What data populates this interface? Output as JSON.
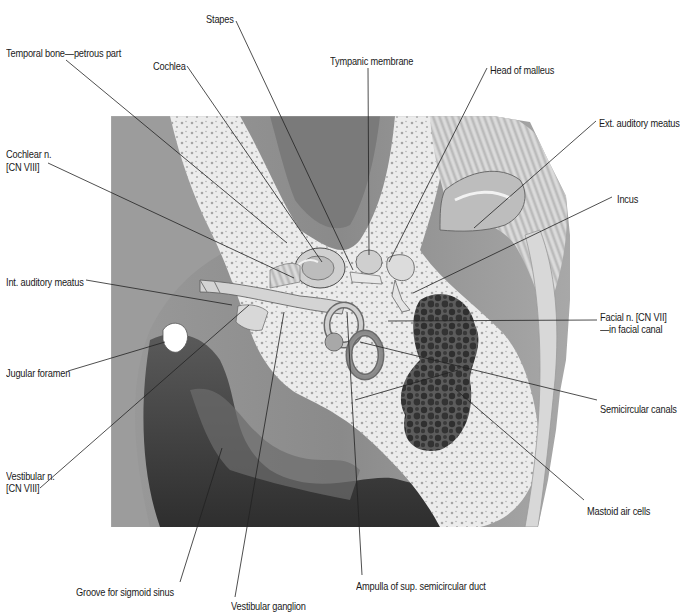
{
  "figure": {
    "colors": {
      "background": "#ffffff",
      "bone_light": "#ebebeb",
      "bone_mid": "#b9b9b9",
      "soft_tissue": "#8f8f8f",
      "dark_cavity": "#3a3a3a",
      "air_cells": "#4a4a4a",
      "leader_line": "#222222",
      "label_text": "#1a1a1a"
    }
  },
  "labels": [
    {
      "id": "stapes",
      "text": "Stapes",
      "x": 206,
      "y": 13
    },
    {
      "id": "temporal-bone-petrous",
      "text": "Temporal bone—petrous part",
      "x": 6,
      "y": 47
    },
    {
      "id": "cochlea",
      "text": "Cochlea",
      "x": 153,
      "y": 60
    },
    {
      "id": "tympanic-membrane",
      "text": "Tympanic membrane",
      "x": 330,
      "y": 55
    },
    {
      "id": "head-of-malleus",
      "text": "Head of malleus",
      "x": 490,
      "y": 64
    },
    {
      "id": "ext-auditory-meatus",
      "text": "Ext. auditory meatus",
      "x": 599,
      "y": 117
    },
    {
      "id": "cochlear-n-line1",
      "text": "Cochlear n.",
      "x": 6,
      "y": 148
    },
    {
      "id": "cochlear-n-line2",
      "text": "[CN VIII]",
      "x": 6,
      "y": 161
    },
    {
      "id": "incus",
      "text": "Incus",
      "x": 617,
      "y": 193
    },
    {
      "id": "int-auditory-meatus",
      "text": "Int. auditory meatus",
      "x": 6,
      "y": 276
    },
    {
      "id": "facial-n-line1",
      "text": "Facial n. [CN VII]",
      "x": 600,
      "y": 311
    },
    {
      "id": "facial-n-line2",
      "text": "—in facial canal",
      "x": 600,
      "y": 323
    },
    {
      "id": "jugular-foramen",
      "text": "Jugular foramen",
      "x": 6,
      "y": 367
    },
    {
      "id": "semicircular-canals",
      "text": "Semicircular canals",
      "x": 600,
      "y": 403
    },
    {
      "id": "vestibular-n-line1",
      "text": "Vestibular n.",
      "x": 6,
      "y": 470
    },
    {
      "id": "vestibular-n-line2",
      "text": "[CN VIII]",
      "x": 6,
      "y": 482
    },
    {
      "id": "mastoid-air-cells",
      "text": "Mastoid air cells",
      "x": 587,
      "y": 505
    },
    {
      "id": "groove-sigmoid-sinus",
      "text": "Groove for sigmoid sinus",
      "x": 76,
      "y": 586
    },
    {
      "id": "ampulla-sup-semicircular-duct",
      "text": "Ampulla of sup. semicircular duct",
      "x": 356,
      "y": 580
    },
    {
      "id": "vestibular-ganglion",
      "text": "Vestibular ganglion",
      "x": 231,
      "y": 600
    }
  ],
  "leaders": [
    {
      "id": "stapes",
      "x1": 236,
      "y1": 21,
      "x2": 353,
      "y2": 270
    },
    {
      "id": "temporal-bone-petrous",
      "x1": 66,
      "y1": 60,
      "x2": 287,
      "y2": 243
    },
    {
      "id": "cochlea",
      "x1": 187,
      "y1": 66,
      "x2": 322,
      "y2": 262
    },
    {
      "id": "tympanic-membrane",
      "x1": 368,
      "y1": 68,
      "x2": 369,
      "y2": 255
    },
    {
      "id": "head-of-malleus",
      "x1": 487,
      "y1": 68,
      "x2": 389,
      "y2": 262
    },
    {
      "id": "ext-auditory-meatus",
      "x1": 596,
      "y1": 121,
      "x2": 474,
      "y2": 228
    },
    {
      "id": "cochlear-n",
      "x1": 48,
      "y1": 163,
      "x2": 294,
      "y2": 278
    },
    {
      "id": "incus",
      "x1": 612,
      "y1": 197,
      "x2": 413,
      "y2": 293
    },
    {
      "id": "int-auditory-meatus",
      "x1": 86,
      "y1": 280,
      "x2": 232,
      "y2": 305
    },
    {
      "id": "facial-n",
      "x1": 597,
      "y1": 320,
      "x2": 388,
      "y2": 321
    },
    {
      "id": "jugular-foramen",
      "x1": 68,
      "y1": 371,
      "x2": 165,
      "y2": 342
    },
    {
      "id": "semicircular-canals-a",
      "x1": 597,
      "y1": 400,
      "x2": 360,
      "y2": 342
    },
    {
      "id": "semicircular-canals-b",
      "x1": 458,
      "y1": 370,
      "x2": 355,
      "y2": 400
    },
    {
      "id": "vestibular-n",
      "x1": 40,
      "y1": 488,
      "x2": 249,
      "y2": 305
    },
    {
      "id": "mastoid-air-cells",
      "x1": 584,
      "y1": 500,
      "x2": 455,
      "y2": 389
    },
    {
      "id": "mastoid-air-cells-b",
      "x1": 457,
      "y1": 390,
      "x2": 452,
      "y2": 390
    },
    {
      "id": "groove-sigmoid-sinus",
      "x1": 180,
      "y1": 582,
      "x2": 222,
      "y2": 448
    },
    {
      "id": "ampulla-sup-semicircular-duct",
      "x1": 362,
      "y1": 575,
      "x2": 347,
      "y2": 312
    },
    {
      "id": "vestibular-ganglion",
      "x1": 235,
      "y1": 597,
      "x2": 284,
      "y2": 312
    }
  ]
}
